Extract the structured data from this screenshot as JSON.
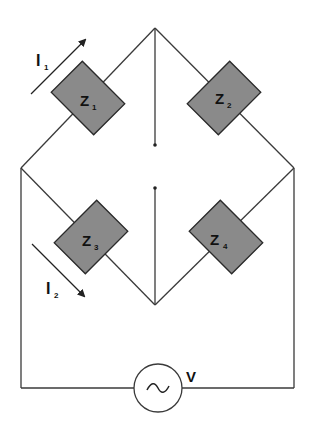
{
  "diagram": {
    "type": "AC bridge circuit",
    "impedances": [
      {
        "id": "Z1",
        "label": "Z",
        "sub": "1"
      },
      {
        "id": "Z2",
        "label": "Z",
        "sub": "2"
      },
      {
        "id": "Z3",
        "label": "Z",
        "sub": "3"
      },
      {
        "id": "Z4",
        "label": "Z",
        "sub": "4"
      }
    ],
    "currents": [
      {
        "id": "I1",
        "label": "I",
        "sub": "1"
      },
      {
        "id": "I2",
        "label": "I",
        "sub": "2"
      }
    ],
    "source": {
      "label": "V",
      "symbol": "~"
    },
    "colors": {
      "wire": "#3a3a3a",
      "impedance_fill": "#8a8a8a",
      "background": "#ffffff"
    }
  }
}
